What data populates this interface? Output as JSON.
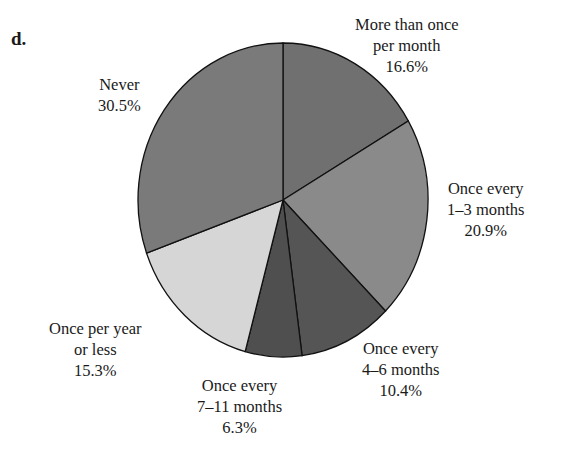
{
  "panel_label": "d.",
  "chart_data": {
    "type": "pie",
    "title": "",
    "slices": [
      {
        "label": "More than once per month",
        "value": 16.6,
        "color": "#707070"
      },
      {
        "label": "Once every 1–3 months",
        "value": 20.9,
        "color": "#8a8a8a"
      },
      {
        "label": "Once every 4–6 months",
        "value": 10.4,
        "color": "#555555"
      },
      {
        "label": "Once every 7–11 months",
        "value": 6.3,
        "color": "#4f4f4f"
      },
      {
        "label": "Once per year or less",
        "value": 15.3,
        "color": "#d6d6d6"
      },
      {
        "label": "Never",
        "value": 30.5,
        "color": "#7a7a7a"
      }
    ],
    "start_angle": "12 o'clock",
    "direction": "clockwise"
  },
  "labels": {
    "more_than_once": {
      "line1": "More than once",
      "line2": "per month",
      "pct": "16.6%"
    },
    "once_1_3": {
      "line1": "Once every",
      "line2": "1–3 months",
      "pct": "20.9%"
    },
    "once_4_6": {
      "line1": "Once every",
      "line2": "4–6 months",
      "pct": "10.4%"
    },
    "once_7_11": {
      "line1": "Once every",
      "line2": "7–11 months",
      "pct": "6.3%"
    },
    "once_year": {
      "line1": "Once per year",
      "line2": "or less",
      "pct": "15.3%"
    },
    "never": {
      "line1": "Never",
      "pct": "30.5%"
    }
  }
}
